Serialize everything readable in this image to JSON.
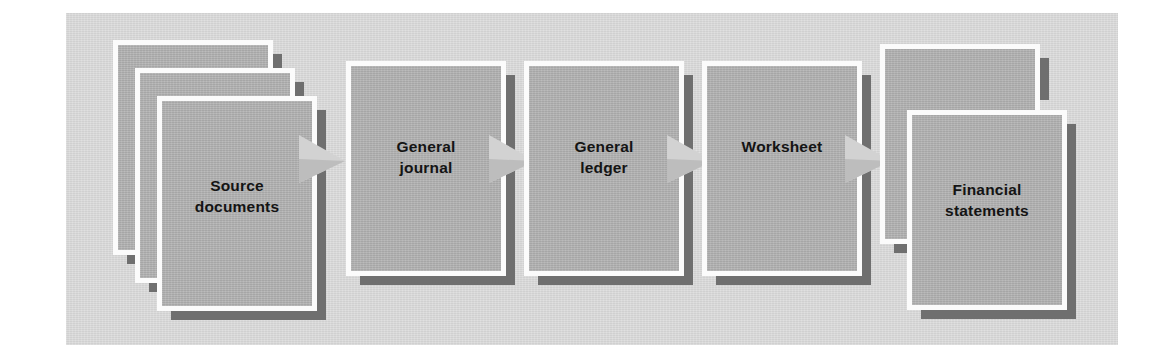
{
  "diagram": {
    "background_color": "#ffffff",
    "panel_color": "#d7d7d7",
    "card_fill_color": "#aeaeae",
    "card_border_color": "#fbfbfb",
    "shadow_color": "#6f6f6f",
    "arrow_color": "#d2d2d2",
    "label_color": "#141414",
    "stages": [
      {
        "id": "source-documents",
        "label": "Source\ndocuments",
        "stack": 3
      },
      {
        "id": "general-journal",
        "label": "General\njournal",
        "stack": 1
      },
      {
        "id": "general-ledger",
        "label": "General\nledger",
        "stack": 1
      },
      {
        "id": "worksheet",
        "label": "Worksheet",
        "stack": 1
      },
      {
        "id": "financial-statements",
        "label": "Financial\nstatements",
        "stack": 2
      }
    ],
    "connectors": [
      {
        "id": "arrow-1",
        "from": "source-documents",
        "to": "general-journal",
        "icon": "arrow-right-icon"
      },
      {
        "id": "arrow-2",
        "from": "general-journal",
        "to": "general-ledger",
        "icon": "arrow-right-icon"
      },
      {
        "id": "arrow-3",
        "from": "general-ledger",
        "to": "worksheet",
        "icon": "arrow-right-icon"
      },
      {
        "id": "arrow-4",
        "from": "worksheet",
        "to": "financial-statements",
        "icon": "arrow-right-icon"
      }
    ]
  }
}
